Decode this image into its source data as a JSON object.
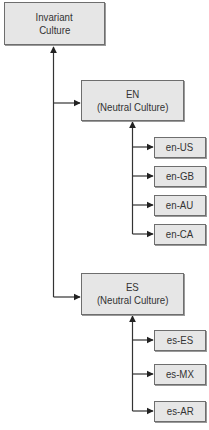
{
  "diagram": {
    "root": {
      "line1": "Invariant",
      "line2": "Culture"
    },
    "neutral": [
      {
        "line1": "EN",
        "line2": "(Neutral Culture)",
        "children": [
          "en-US",
          "en-GB",
          "en-AU",
          "en-CA"
        ]
      },
      {
        "line1": "ES",
        "line2": "(Neutral Culture)",
        "children": [
          "es-ES",
          "es-MX",
          "es-AR"
        ]
      }
    ]
  },
  "colors": {
    "box_fill": "#e6e6e6",
    "box_border": "#6e6e6e",
    "line": "#333333",
    "text": "#333333"
  }
}
